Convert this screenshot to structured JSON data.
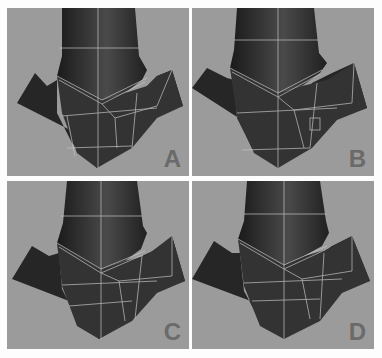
{
  "figure": {
    "panels": [
      {
        "label": "A",
        "variant": "a"
      },
      {
        "label": "B",
        "variant": "b"
      },
      {
        "label": "C",
        "variant": "c"
      },
      {
        "label": "D",
        "variant": "d"
      }
    ]
  },
  "colors": {
    "background": "#fdfdfd",
    "panel_bg": "#9b9b9b",
    "object_dark": "#1e1e1e",
    "object_mid": "#3a3a3a",
    "wire": "#c8c8c8",
    "label": "#6a6a6a"
  }
}
